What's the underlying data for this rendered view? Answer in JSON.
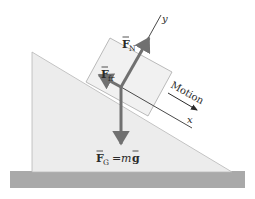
{
  "diagram": {
    "colors": {
      "incline_fill": "#ececec",
      "incline_stroke": "#b8b8b8",
      "block_fill": "#f1f1f1",
      "block_stroke": "#a9a9a9",
      "ground_fill": "#a9a9a9",
      "force_arrow": "#707070",
      "axis_line": "#4a4a4a",
      "text": "#2a2a2a"
    },
    "labels": {
      "normal_force": {
        "symbol": "F",
        "subscript": "N"
      },
      "friction_force": {
        "symbol": "F",
        "subscript": "fr"
      },
      "gravity_force": {
        "symbol": "F",
        "subscript": "G",
        "equals": "=",
        "rhs_m": "m",
        "rhs_g": "g"
      },
      "y_axis": "y",
      "x_axis": "x",
      "motion": "Motion"
    }
  }
}
